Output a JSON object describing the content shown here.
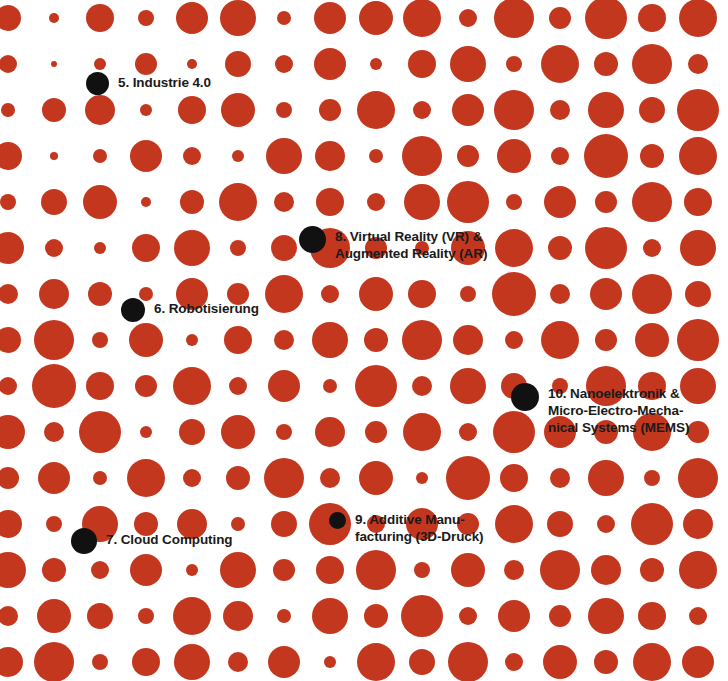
{
  "graphic": {
    "title": "Technologie-Trends Punktraster",
    "width": 728,
    "height": 681,
    "background_color": "#ffffff",
    "dot_color": "#c4371f",
    "marker_color": "#111111",
    "label_color": "#1a1a1a"
  },
  "markers": [
    {
      "id": "industrie-40",
      "number": "5.",
      "label": "5. Industrie 4.0",
      "lines": [
        "5. Industrie 4.0"
      ],
      "dot_x": 86,
      "dot_y": 72,
      "dot_size": 23,
      "label_offset_y": 2
    },
    {
      "id": "robotisierung",
      "number": "6.",
      "label": "6. Robotisierung",
      "lines": [
        "6. Robotisierung"
      ],
      "dot_x": 121,
      "dot_y": 298,
      "dot_size": 24,
      "label_offset_y": 2
    },
    {
      "id": "cloud-computing",
      "number": "7.",
      "label": "7. Cloud Computing",
      "lines": [
        "7. Cloud Computing"
      ],
      "dot_x": 71,
      "dot_y": 528,
      "dot_size": 26,
      "label_offset_y": 3
    },
    {
      "id": "virtual-augmented-reality",
      "number": "8.",
      "label": "8. Virtual Reality (VR) & Augmented Reality (AR)",
      "lines": [
        "8. Virtual Reality (VR) &",
        "Augmented Reality (AR)"
      ],
      "dot_x": 299,
      "dot_y": 226,
      "dot_size": 27,
      "label_offset_y": 2
    },
    {
      "id": "additive-manufacturing",
      "number": "9.",
      "label": "9. Additive Manufacturing (3D-Druck)",
      "lines": [
        "9. Additive Manu-",
        "facturing (3D-Druck)"
      ],
      "dot_x": 329,
      "dot_y": 512,
      "dot_size": 17,
      "label_offset_y": -1
    },
    {
      "id": "nanoelektronik-mems",
      "number": "10.",
      "label": "10. Nanoelektronik & Micro-Electro-Mechanical Systems (MEMS)",
      "lines": [
        "10. Nanoelektronik &",
        "Micro-Electro-Mecha-",
        "nical Systems (MEMS)"
      ],
      "dot_x": 511,
      "dot_y": 383,
      "dot_size": 28,
      "label_offset_y": 2
    }
  ],
  "chart_data": {
    "type": "scatter",
    "xlabel": "",
    "ylabel": "",
    "grid": false,
    "legend": "none",
    "note": "Raster aus roten Punkten mit variabler Groesse; sechs schwarze Markierungspunkte tragen Beschriftungen.",
    "columns": 16,
    "rows": 15,
    "col_spacing": 46,
    "row_spacing": 46,
    "origin_x": 8,
    "origin_y": 18,
    "radii": [
      [
        13,
        5,
        14,
        8,
        16,
        18,
        7,
        16,
        17,
        19,
        9,
        20,
        11,
        21,
        14,
        19
      ],
      [
        9,
        3,
        6,
        11,
        5,
        13,
        9,
        16,
        6,
        14,
        18,
        8,
        19,
        12,
        20,
        10
      ],
      [
        7,
        12,
        15,
        6,
        14,
        17,
        8,
        11,
        19,
        9,
        16,
        20,
        10,
        18,
        13,
        21
      ],
      [
        14,
        4,
        7,
        16,
        9,
        6,
        18,
        15,
        7,
        20,
        11,
        17,
        9,
        22,
        12,
        19
      ],
      [
        8,
        13,
        17,
        5,
        12,
        19,
        10,
        14,
        9,
        18,
        21,
        8,
        16,
        11,
        20,
        14
      ],
      [
        16,
        9,
        6,
        14,
        18,
        8,
        13,
        20,
        11,
        7,
        17,
        19,
        12,
        21,
        9,
        18
      ],
      [
        10,
        15,
        12,
        7,
        16,
        11,
        19,
        9,
        17,
        14,
        8,
        22,
        10,
        16,
        20,
        13
      ],
      [
        13,
        20,
        8,
        17,
        6,
        14,
        10,
        18,
        12,
        20,
        15,
        9,
        19,
        11,
        17,
        21
      ],
      [
        9,
        22,
        14,
        11,
        19,
        9,
        16,
        7,
        21,
        10,
        18,
        13,
        8,
        20,
        14,
        18
      ],
      [
        17,
        10,
        21,
        6,
        13,
        17,
        8,
        15,
        11,
        19,
        9,
        21,
        16,
        12,
        19,
        11
      ],
      [
        11,
        16,
        7,
        19,
        9,
        12,
        20,
        10,
        17,
        6,
        22,
        14,
        10,
        18,
        8,
        20
      ],
      [
        14,
        8,
        18,
        12,
        15,
        7,
        13,
        21,
        9,
        16,
        11,
        19,
        13,
        9,
        21,
        15
      ],
      [
        18,
        12,
        9,
        16,
        6,
        18,
        11,
        14,
        20,
        8,
        17,
        10,
        20,
        15,
        12,
        19
      ],
      [
        10,
        17,
        13,
        8,
        19,
        15,
        7,
        18,
        12,
        21,
        9,
        16,
        11,
        18,
        14,
        9
      ],
      [
        15,
        20,
        8,
        14,
        18,
        10,
        16,
        6,
        19,
        13,
        20,
        9,
        17,
        12,
        19,
        16
      ]
    ]
  }
}
